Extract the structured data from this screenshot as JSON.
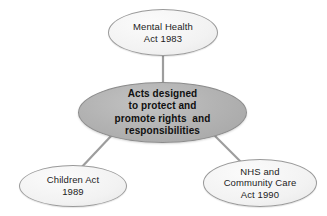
{
  "diagram": {
    "type": "hub-and-spoke",
    "background_color": "#ffffff",
    "hub": {
      "id": "acts-hub",
      "label": "Acts designed\nto protect and\npromote rights  and\nresponsibilities",
      "fill_color": "#a8a8a8",
      "border_color": "#8c8c8c",
      "text_color": "#101010"
    },
    "nodes": [
      {
        "id": "mental-health-act",
        "label": "Mental Health\nAct 1983",
        "position": "top",
        "fill_color": "#ededed",
        "border_color": "#9a9a9a",
        "text_color": "#1c1c1c"
      },
      {
        "id": "children-act",
        "label": "Children Act\n1989",
        "position": "bottom-left",
        "fill_color": "#ededed",
        "border_color": "#9a9a9a",
        "text_color": "#1c1c1c"
      },
      {
        "id": "nhs-community-care-act",
        "label": "NHS and\nCommunity Care\nAct 1990",
        "position": "bottom-right",
        "fill_color": "#ededed",
        "border_color": "#9a9a9a",
        "text_color": "#1c1c1c"
      }
    ],
    "connectors": [
      {
        "id": "hub-to-mental-health",
        "from": "acts-hub",
        "to": "mental-health-act",
        "color": "#9d9d9d"
      },
      {
        "id": "hub-to-children-act",
        "from": "acts-hub",
        "to": "children-act",
        "color": "#9d9d9d"
      },
      {
        "id": "hub-to-nhs",
        "from": "acts-hub",
        "to": "nhs-community-care-act",
        "color": "#9d9d9d"
      }
    ]
  }
}
